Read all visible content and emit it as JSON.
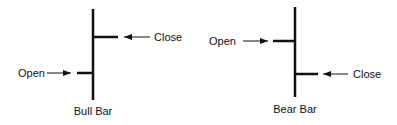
{
  "bull_bar": {
    "title": "Bull Bar",
    "open_label": "Open",
    "close_label": "Close"
  },
  "bear_bar": {
    "title": "Bear Bar",
    "open_label": "Open",
    "close_label": "Close"
  },
  "colors": {
    "line": "#111111",
    "background": "#ffffff"
  }
}
